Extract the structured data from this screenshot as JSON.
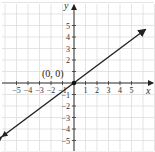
{
  "chart_data": {
    "type": "line",
    "title": "",
    "xlabel": "x",
    "ylabel": "y",
    "xlim": [
      -6.3,
      6.8
    ],
    "ylim": [
      -5.8,
      6.8
    ],
    "grid": true,
    "xticks": [
      -5,
      -4,
      -3,
      -2,
      -1,
      1,
      2,
      3,
      4,
      5
    ],
    "yticks": [
      -5,
      -4,
      -3,
      -2,
      -1,
      1,
      2,
      3,
      4,
      5
    ],
    "xtick_labels": [
      "−5",
      "−4",
      "−3",
      "−2",
      "−1",
      "1",
      "2",
      "3",
      "4",
      "5"
    ],
    "ytick_labels": [
      "−5",
      "−4",
      "−3",
      "−2",
      "−1",
      "1",
      "2",
      "3",
      "4",
      "5"
    ],
    "series": [
      {
        "name": "line",
        "equation": "y = 0.75x",
        "slope": 0.75,
        "intercept": 0,
        "arrows": "both",
        "x": [
          -6.3,
          6.2
        ],
        "y": [
          -4.7,
          4.65
        ]
      }
    ],
    "annotations": [
      {
        "text": "(0, 0)",
        "x": 0,
        "y": 0,
        "marker": "point"
      }
    ]
  },
  "labels": {
    "x_axis": "x",
    "y_axis": "y",
    "origin_point": "(0, 0)"
  }
}
